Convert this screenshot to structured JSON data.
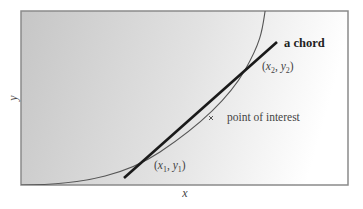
{
  "diagram": {
    "axes": {
      "xlabel": "x",
      "ylabel": "y"
    },
    "annotations": {
      "chord_label": "a chord",
      "point1_label": {
        "open": "(",
        "x": "x",
        "xsub": "1",
        "comma": ", ",
        "y": "y",
        "ysub": "1",
        "close": ")"
      },
      "point2_label": {
        "open": "(",
        "x": "x",
        "xsub": "2",
        "comma": ", ",
        "y": "y",
        "ysub": "2",
        "close": ")"
      },
      "interest_label": "point of interest"
    },
    "colors": {
      "frame": "#8a8a8a",
      "bg_left": "#c8c8c8",
      "bg_right": "#ffffff",
      "curve": "#555555",
      "chord": "#1a1a1a"
    }
  }
}
